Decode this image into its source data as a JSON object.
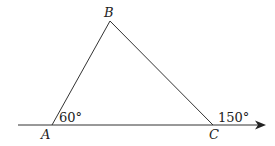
{
  "diagram": {
    "points": {
      "A": {
        "label": "A",
        "x": 52,
        "y": 125
      },
      "B": {
        "label": "B",
        "x": 110,
        "y": 21
      },
      "C": {
        "label": "C",
        "x": 213,
        "y": 125
      }
    },
    "angles": {
      "at_A": "60°",
      "exterior_at_C": "150°"
    },
    "line_color": "#333333"
  }
}
